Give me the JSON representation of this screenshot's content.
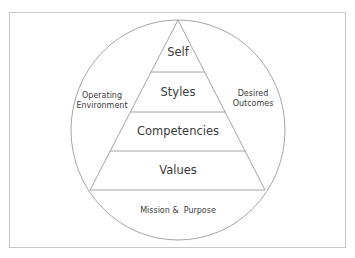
{
  "diagram": {
    "type": "pyramid-in-circle",
    "pyramid_layers": [
      {
        "label": "Self"
      },
      {
        "label": "Styles"
      },
      {
        "label": "Competencies"
      },
      {
        "label": "Values"
      }
    ],
    "circle_regions": {
      "left": {
        "line1": "Operating",
        "line2": "Environment"
      },
      "right": {
        "line1": "Desired",
        "line2": "Outcomes"
      },
      "bottom": {
        "label": "Mission &  Purpose"
      }
    },
    "colors": {
      "line": "#9a9a9a",
      "frame": "#c8c8c8",
      "text": "#3a3a3a",
      "background": "#ffffff"
    }
  }
}
